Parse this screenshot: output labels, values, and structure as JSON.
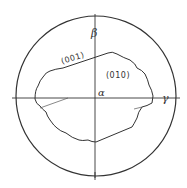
{
  "diagram": {
    "type": "stereographic-projection",
    "colors": {
      "line": "#333333",
      "background": "#ffffff"
    },
    "axes": {
      "beta": "β",
      "gamma": "γ",
      "alpha": "α"
    },
    "faces": {
      "top_edge": "(001)",
      "interior": "(010)"
    }
  }
}
